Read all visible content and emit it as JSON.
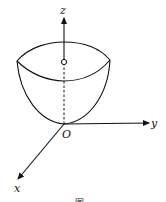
{
  "figure": {
    "type": "3d-paraboloid-surface",
    "axes": {
      "z_label": "z",
      "y_label": "y",
      "x_label": "x",
      "origin_label": "O"
    },
    "caption": "图"
  }
}
